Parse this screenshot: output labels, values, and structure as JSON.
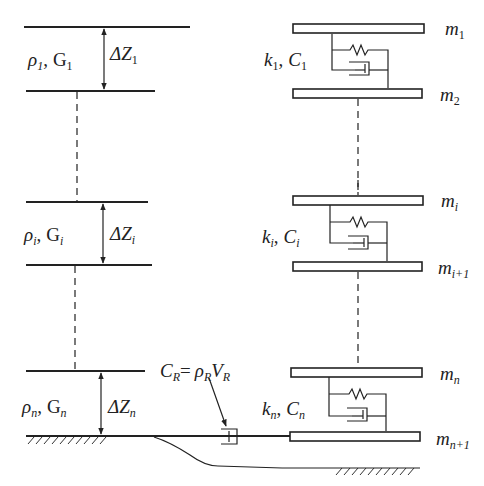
{
  "left_layers": [
    {
      "rho": "ρ",
      "rho_sub": "1",
      "G": "G",
      "G_sub": "1",
      "dz": "ΔZ",
      "dz_sub": "1"
    },
    {
      "rho": "ρ",
      "rho_sub": "i",
      "G": "G",
      "G_sub": "i",
      "dz": "ΔZ",
      "dz_sub": "i"
    },
    {
      "rho": "ρ",
      "rho_sub": "n",
      "G": "G",
      "G_sub": "n",
      "dz": "ΔZ",
      "dz_sub": "n"
    }
  ],
  "right_masses": [
    {
      "m": "m",
      "sub": "1"
    },
    {
      "m": "m",
      "sub": "2"
    },
    {
      "m": "m",
      "sub": "i"
    },
    {
      "m": "m",
      "sub": "i+1"
    },
    {
      "m": "m",
      "sub": "n"
    },
    {
      "m": "m",
      "sub": "n+1"
    }
  ],
  "springs": [
    {
      "k": "k",
      "k_sub": "1",
      "c": "C",
      "c_sub": "1"
    },
    {
      "k": "k",
      "k_sub": "i",
      "c": "C",
      "c_sub": "i"
    },
    {
      "k": "k",
      "k_sub": "n",
      "c": "C",
      "c_sub": "n"
    }
  ],
  "radiation_damper": {
    "lhs": "C",
    "lhs_sub": "R",
    "eq": "=",
    "rho": "ρ",
    "rho_sub": "R",
    "v": "V",
    "v_sub": "R"
  },
  "separator": ","
}
